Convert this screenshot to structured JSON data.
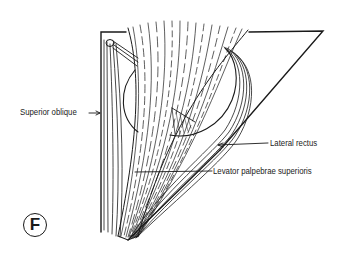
{
  "figure": {
    "plate_letter": "F",
    "labels": {
      "superior_oblique": "Superior oblique",
      "lateral_rectus": "Lateral rectus",
      "levator": "Levator palpebrae superioris"
    },
    "colors": {
      "ink": "#1a1a1a",
      "background": "#ffffff"
    }
  }
}
